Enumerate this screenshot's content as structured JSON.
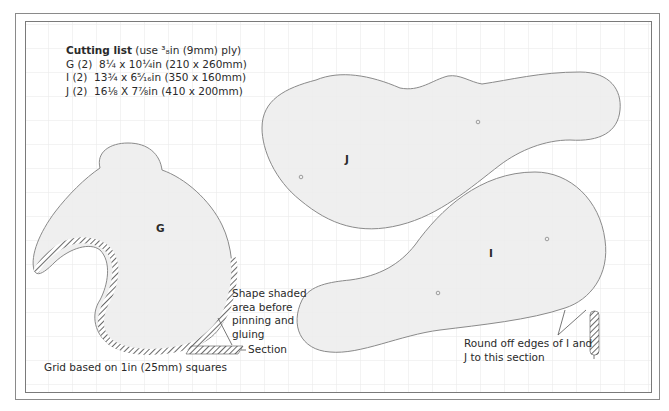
{
  "cutting_list": {
    "title": "Cutting list",
    "subtitle": "(use ³₈in (9mm) ply)",
    "items": [
      {
        "piece": "G",
        "qty": "(2)",
        "dims": "8¼ x 10¼in (210 x 260mm)"
      },
      {
        "piece": "I",
        "qty": "(2)",
        "dims": "13¾ x 6⁵⁄₁₆in (350 x 160mm)"
      },
      {
        "piece": "J",
        "qty": "(2)",
        "dims": "16⅛ X 7⅞in (410 x 200mm)"
      }
    ]
  },
  "pieces": {
    "G": {
      "label": "G"
    },
    "I": {
      "label": "I"
    },
    "J": {
      "label": "J"
    }
  },
  "annotations": {
    "shape_shaded": [
      "Shape shaded",
      "area before",
      "pinning and",
      "gluing"
    ],
    "section": "Section",
    "round_off": [
      "Round off edges of I and",
      "J to this section"
    ],
    "grid_note": "Grid based on 1in (25mm) squares"
  },
  "colors": {
    "shape_fill": "#ececec",
    "shape_stroke": "#8a8a8a",
    "grid_line": "#e6e6e6",
    "frame": "#7a7a7a",
    "text": "#2a2a2a"
  },
  "grid": {
    "spacing_px": 24
  }
}
